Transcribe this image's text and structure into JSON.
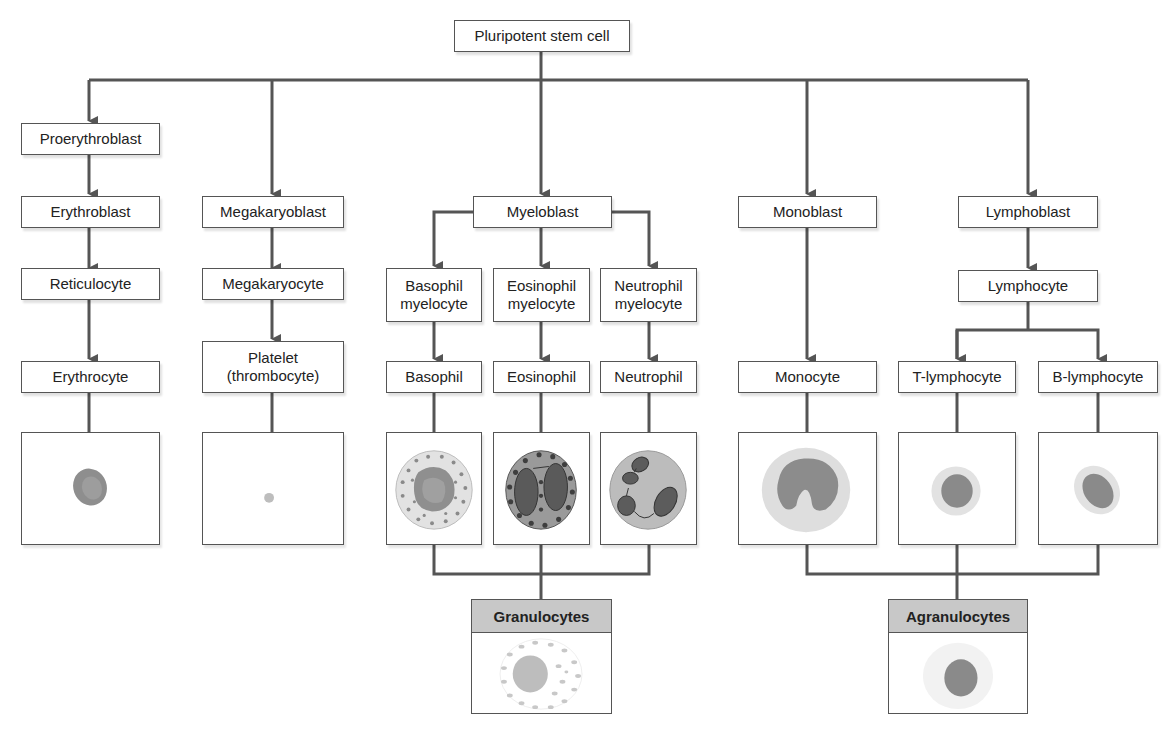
{
  "diagram": {
    "type": "hierarchy",
    "root": "Pluripotent stem cell",
    "colors": {
      "line": "#555555",
      "box_border": "#555555",
      "group_header": "#c8c8c8",
      "cell_nucleus": "#8a8a8a",
      "cell_cytoplasm": "#d8d8d8"
    },
    "lineages": {
      "erythroid": [
        "Proerythroblast",
        "Erythroblast",
        "Reticulocyte",
        "Erythrocyte"
      ],
      "megakaryocytic": [
        "Megakaryoblast",
        "Megakaryocyte",
        "Platelet (thrombocyte)"
      ],
      "myeloid": {
        "root": "Myeloblast",
        "branches": [
          [
            "Basophil myelocyte",
            "Basophil"
          ],
          [
            "Eosinophil myelocyte",
            "Eosinophil"
          ],
          [
            "Neutrophil myelocyte",
            "Neutrophil"
          ]
        ]
      },
      "monocytic": [
        "Monoblast",
        "Monocyte"
      ],
      "lymphoid": {
        "root": "Lymphoblast",
        "next": "Lymphocyte",
        "branches": [
          "T-lymphocyte",
          "B-lymphocyte"
        ]
      }
    },
    "groups": [
      {
        "label": "Granulocytes",
        "members": [
          "Basophil",
          "Eosinophil",
          "Neutrophil"
        ]
      },
      {
        "label": "Agranulocytes",
        "members": [
          "Monocyte",
          "T-lymphocyte",
          "B-lymphocyte"
        ]
      }
    ]
  },
  "labels": {
    "root": "Pluripotent stem cell",
    "proerythroblast": "Proerythroblast",
    "erythroblast": "Erythroblast",
    "reticulocyte": "Reticulocyte",
    "erythrocyte": "Erythrocyte",
    "megakaryoblast": "Megakaryoblast",
    "megakaryocyte": "Megakaryocyte",
    "platelet_line1": "Platelet",
    "platelet_line2": "(thrombocyte)",
    "myeloblast": "Myeloblast",
    "basophil_myelocyte_line1": "Basophil",
    "basophil_myelocyte_line2": "myelocyte",
    "eosinophil_myelocyte_line1": "Eosinophil",
    "eosinophil_myelocyte_line2": "myelocyte",
    "neutrophil_myelocyte_line1": "Neutrophil",
    "neutrophil_myelocyte_line2": "myelocyte",
    "basophil": "Basophil",
    "eosinophil": "Eosinophil",
    "neutrophil": "Neutrophil",
    "monoblast": "Monoblast",
    "monocyte": "Monocyte",
    "lymphoblast": "Lymphoblast",
    "lymphocyte": "Lymphocyte",
    "t_lymphocyte": "T-lymphocyte",
    "b_lymphocyte": "B-lymphocyte",
    "granulocytes": "Granulocytes",
    "agranulocytes": "Agranulocytes"
  }
}
